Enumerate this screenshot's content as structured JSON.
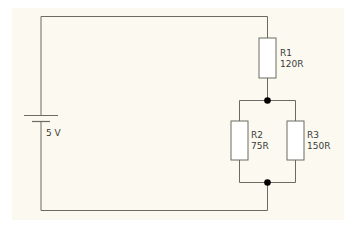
{
  "diagram": {
    "type": "circuit-schematic",
    "colors": {
      "background": "#fcfaf0",
      "wire": "#6b6b62",
      "resistor_fill": "#ffffff",
      "node": "#000000",
      "text": "#3a3a3a"
    },
    "source": {
      "name": "battery",
      "label": "5 V"
    },
    "components": [
      {
        "id": "R1",
        "label": "R1",
        "value": "120R",
        "connection": "series"
      },
      {
        "id": "R2",
        "label": "R2",
        "value": "75R",
        "connection": "parallel"
      },
      {
        "id": "R3",
        "label": "R3",
        "value": "150R",
        "connection": "parallel"
      }
    ]
  }
}
